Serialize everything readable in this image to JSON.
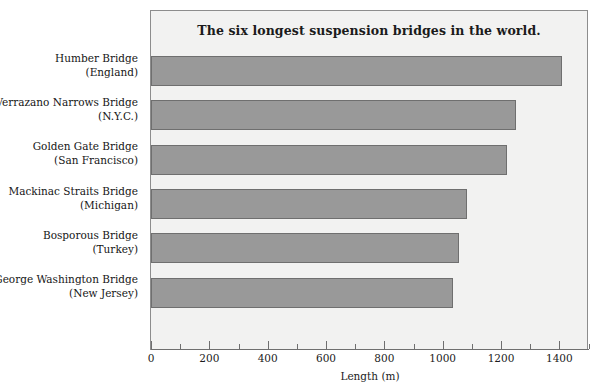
{
  "chart_data": {
    "type": "bar",
    "orientation": "horizontal",
    "title": "The six longest suspension bridges in the world.",
    "xlabel": "Length (m)",
    "ylabel": "",
    "xlim": [
      0,
      1500
    ],
    "grid": false,
    "legend": null,
    "bar_color": "#999999",
    "bar_edge_color": "#6f6f6f",
    "plot_background": "#f2f2f1",
    "categories": [
      {
        "name": "Humber Bridge",
        "sub": "(England)"
      },
      {
        "name": "Verrazano Narrows Bridge",
        "sub": "(N.Y.C.)"
      },
      {
        "name": "Golden Gate Bridge",
        "sub": "(San Francisco)"
      },
      {
        "name": "Mackinac Straits Bridge",
        "sub": "(Michigan)"
      },
      {
        "name": "Bosporous Bridge",
        "sub": "(Turkey)"
      },
      {
        "name": "George Washington Bridge",
        "sub": "(New Jersey)"
      }
    ],
    "values": [
      1410,
      1250,
      1220,
      1085,
      1055,
      1035
    ],
    "xticks": [
      0,
      200,
      400,
      600,
      800,
      1000,
      1200,
      1400
    ],
    "xtick_labels": [
      "0",
      "200",
      "400",
      "600",
      "800",
      "1000",
      "1200",
      "1400"
    ],
    "xminor_ticks": [
      100,
      300,
      500,
      700,
      900,
      1100,
      1300,
      1500
    ]
  },
  "page": {
    "caption_fragment": ""
  }
}
